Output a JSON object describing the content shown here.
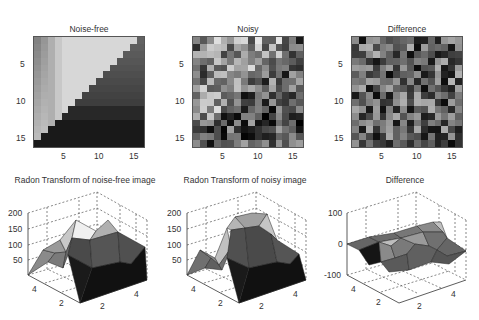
{
  "chart_data": [
    {
      "type": "heatmap",
      "title": "Noise-free",
      "xticks": [
        "5",
        "10",
        "15"
      ],
      "yticks": [
        "5",
        "10",
        "15"
      ],
      "xlim": [
        0.5,
        16.5
      ],
      "ylim": [
        0.5,
        16.5
      ],
      "colormap": "gray",
      "description": "16x16 image with bright upper-left triangle and dark lower-right region separated by a diagonal edge"
    },
    {
      "type": "heatmap",
      "title": "Noisy",
      "xticks": [
        "5",
        "10",
        "15"
      ],
      "yticks": [
        "5",
        "10",
        "15"
      ],
      "xlim": [
        0.5,
        16.5
      ],
      "ylim": [
        0.5,
        16.5
      ],
      "colormap": "gray",
      "description": "16x16 noisy image, random gray values"
    },
    {
      "type": "heatmap",
      "title": "Difference",
      "xticks": [
        "5",
        "10",
        "15"
      ],
      "yticks": [
        "5",
        "10",
        "15"
      ],
      "xlim": [
        0.5,
        16.5
      ],
      "ylim": [
        0.5,
        16.5
      ],
      "colormap": "gray",
      "description": "16x16 difference image, random gray values"
    },
    {
      "type": "surface",
      "title": "Radon Transform of noise-free image",
      "zticks": [
        "50",
        "100",
        "150",
        "200"
      ],
      "xticks": [
        "2",
        "4"
      ],
      "yticks": [
        "2",
        "4"
      ],
      "zlim": [
        0,
        200
      ],
      "grid": true
    },
    {
      "type": "surface",
      "title": "Radon Transform of noisy image",
      "zticks": [
        "50",
        "100",
        "150",
        "200"
      ],
      "xticks": [
        "2",
        "4"
      ],
      "yticks": [
        "2",
        "4"
      ],
      "zlim": [
        0,
        200
      ],
      "grid": true
    },
    {
      "type": "surface",
      "title": "Difference",
      "zticks": [
        "-100",
        "0",
        "100"
      ],
      "xticks": [
        "2",
        "4"
      ],
      "yticks": [
        "2",
        "4"
      ],
      "zlim": [
        -100,
        100
      ],
      "grid": true
    }
  ],
  "panels": {
    "p1": {
      "title": "Noise-free"
    },
    "p2": {
      "title": "Noisy"
    },
    "p3": {
      "title": "Difference"
    },
    "p4": {
      "title": "Radon Transform of noise-free image"
    },
    "p5": {
      "title": "Radon Transform of noisy image"
    },
    "p6": {
      "title": "Difference"
    }
  },
  "ticks": {
    "img": [
      "5",
      "10",
      "15"
    ],
    "z200": [
      "200",
      "150",
      "100",
      "50"
    ],
    "z100": [
      "100",
      "0",
      "-100"
    ],
    "xy": [
      "2",
      "4"
    ]
  }
}
